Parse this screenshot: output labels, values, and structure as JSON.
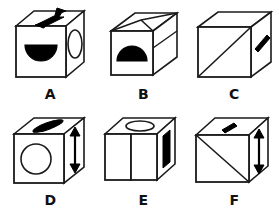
{
  "figure": {
    "background_color": "#ffffff",
    "stroke_color": "#1a1a1a",
    "fill_color": "#ffffff",
    "mark_color": "#000000",
    "rows": 2,
    "columns": 3,
    "cubes": [
      {
        "label": "A",
        "view": "isometric-left-front-top",
        "marks": [
          {
            "face": "front",
            "icon": "filled-half-circle-flat-up",
            "fill": "#000000"
          },
          {
            "face": "right",
            "icon": "ellipse-outline",
            "fill": "#ffffff"
          },
          {
            "face": "top",
            "icon": "double-headed-arrow-diagonal",
            "fill": "#000000"
          }
        ]
      },
      {
        "label": "B",
        "view": "isometric-front-top-peak",
        "marks": [
          {
            "face": "front",
            "icon": "filled-half-circle-dome-up",
            "fill": "#000000"
          },
          {
            "face": "right",
            "icon": "blank",
            "fill": "#ffffff"
          },
          {
            "face": "top",
            "icon": "blank",
            "fill": "#ffffff"
          }
        ]
      },
      {
        "label": "C",
        "view": "isometric-left-front-top",
        "marks": [
          {
            "face": "front",
            "icon": "diagonal-line-bottomleft-topright",
            "fill": "#ffffff"
          },
          {
            "face": "right",
            "icon": "thick-bar-diagonal",
            "fill": "#000000"
          },
          {
            "face": "top",
            "icon": "blank",
            "fill": "#ffffff"
          }
        ]
      },
      {
        "label": "D",
        "view": "isometric-left-front-top",
        "marks": [
          {
            "face": "front",
            "icon": "circle-outline",
            "fill": "#ffffff"
          },
          {
            "face": "right",
            "icon": "double-headed-arrow-vertical",
            "fill": "#000000"
          },
          {
            "face": "top",
            "icon": "filled-ellipse-flat",
            "fill": "#000000"
          }
        ]
      },
      {
        "label": "E",
        "view": "isometric-corner-two-front-faces",
        "marks": [
          {
            "face": "front-left",
            "icon": "blank",
            "fill": "#ffffff"
          },
          {
            "face": "front-right",
            "icon": "blank",
            "fill": "#ffffff"
          },
          {
            "face": "right",
            "icon": "thick-bar-vertical",
            "fill": "#000000"
          },
          {
            "face": "top",
            "icon": "ellipse-outline",
            "fill": "#ffffff"
          }
        ]
      },
      {
        "label": "F",
        "view": "isometric-left-front-top",
        "marks": [
          {
            "face": "front",
            "icon": "diagonal-line-topleft-bottomright",
            "fill": "#ffffff"
          },
          {
            "face": "right",
            "icon": "double-headed-arrow-vertical",
            "fill": "#000000"
          },
          {
            "face": "top",
            "icon": "thick-bar-short-diagonal",
            "fill": "#000000"
          }
        ]
      }
    ]
  }
}
